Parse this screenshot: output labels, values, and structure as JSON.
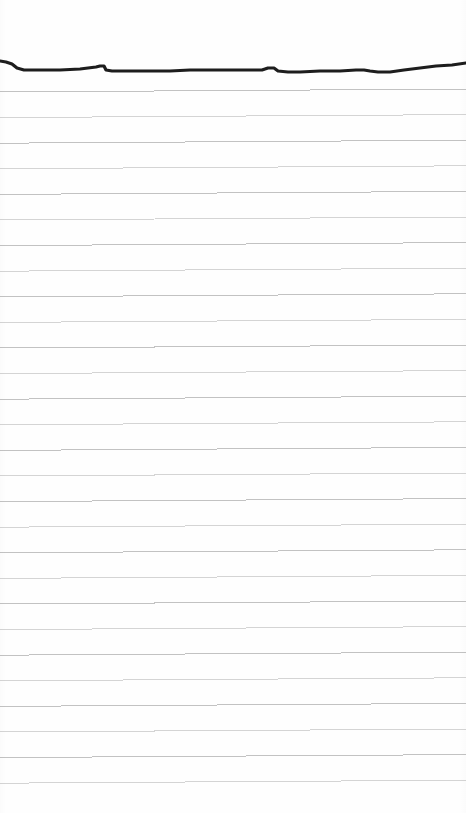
{
  "document": {
    "kind": "scanned-ruled-notebook-paper",
    "page_label": "",
    "written_text": "",
    "width_px": 466,
    "height_px": 813
  },
  "colors": {
    "background": "#ffffff",
    "paper": "#fefefe",
    "rule_line": "#c2c2c2",
    "rule_line_faint": "#d4d4d4",
    "ink_stroke": "#1d1d1d"
  },
  "ruling": {
    "line_count": 28,
    "first_line_y": 92,
    "spacing_px": 25.6,
    "left_x": 0,
    "right_x": 466,
    "tilt_px": -3,
    "stroke_width": 1,
    "margin_line_visible": false
  },
  "ink_stroke": {
    "name": "horizontal-ink-rule",
    "description": "thick hand-drawn dark horizontal line near top of page",
    "stroke_width": 3.2,
    "start_y": 61,
    "end_y": 64,
    "points": [
      [
        0,
        61
      ],
      [
        6,
        62
      ],
      [
        12,
        64
      ],
      [
        17,
        68
      ],
      [
        24,
        70
      ],
      [
        40,
        70
      ],
      [
        60,
        70
      ],
      [
        80,
        69
      ],
      [
        96,
        67
      ],
      [
        100,
        66
      ],
      [
        104,
        66
      ],
      [
        106,
        70
      ],
      [
        112,
        71
      ],
      [
        130,
        71
      ],
      [
        150,
        71
      ],
      [
        170,
        71
      ],
      [
        190,
        70
      ],
      [
        210,
        70
      ],
      [
        230,
        70
      ],
      [
        250,
        70
      ],
      [
        262,
        70
      ],
      [
        268,
        68
      ],
      [
        274,
        68
      ],
      [
        278,
        71
      ],
      [
        288,
        72
      ],
      [
        300,
        72
      ],
      [
        320,
        71
      ],
      [
        340,
        71
      ],
      [
        356,
        70
      ],
      [
        364,
        70
      ],
      [
        370,
        71
      ],
      [
        378,
        72
      ],
      [
        390,
        72
      ],
      [
        404,
        70
      ],
      [
        420,
        68
      ],
      [
        436,
        66
      ],
      [
        452,
        65
      ],
      [
        466,
        63
      ]
    ]
  }
}
